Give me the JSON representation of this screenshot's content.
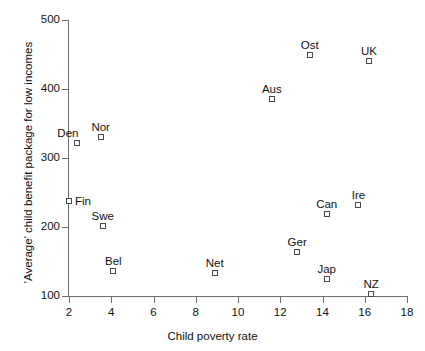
{
  "chart_data": {
    "type": "scatter",
    "title": "",
    "xlabel": "Child poverty rate",
    "ylabel": "'Average' child benefit package for low incomes",
    "xlim": [
      2,
      18
    ],
    "ylim": [
      100,
      500
    ],
    "xticks": [
      "2",
      "4",
      "6",
      "8",
      "10",
      "12",
      "14",
      "16",
      "18"
    ],
    "yticks": [
      "100",
      "200",
      "300",
      "400",
      "500"
    ],
    "grid": false,
    "legend": false,
    "marker": "open-square",
    "points": [
      {
        "label": "Den",
        "x": 2.4,
        "y": 322,
        "label_pos": "left"
      },
      {
        "label": "Nor",
        "x": 3.5,
        "y": 330,
        "label_pos": "center"
      },
      {
        "label": "Fin",
        "x": 2.0,
        "y": 237,
        "label_pos": "right"
      },
      {
        "label": "Swe",
        "x": 3.6,
        "y": 201,
        "label_pos": "center"
      },
      {
        "label": "Bel",
        "x": 4.1,
        "y": 136,
        "label_pos": "center"
      },
      {
        "label": "Net",
        "x": 8.9,
        "y": 133,
        "label_pos": "center"
      },
      {
        "label": "Aus",
        "x": 11.6,
        "y": 385,
        "label_pos": "center"
      },
      {
        "label": "Ost",
        "x": 13.4,
        "y": 450,
        "label_pos": "center"
      },
      {
        "label": "UK",
        "x": 16.2,
        "y": 440,
        "label_pos": "center"
      },
      {
        "label": "Ger",
        "x": 12.8,
        "y": 164,
        "label_pos": "center"
      },
      {
        "label": "Can",
        "x": 14.2,
        "y": 219,
        "label_pos": "center"
      },
      {
        "label": "Ire",
        "x": 15.7,
        "y": 232,
        "label_pos": "center"
      },
      {
        "label": "Jap",
        "x": 14.2,
        "y": 124,
        "label_pos": "center"
      },
      {
        "label": "NZ",
        "x": 16.3,
        "y": 103,
        "label_pos": "center"
      }
    ],
    "colors": {
      "axis": "#6e6e6e",
      "text": "#111111",
      "marker_edge": "#4a4a4a",
      "marker_fill": "#ffffff",
      "background": "#ffffff"
    }
  }
}
